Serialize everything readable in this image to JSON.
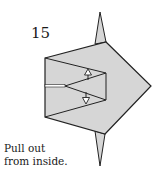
{
  "step": {
    "number": "15"
  },
  "caption": {
    "line1": "Pull out",
    "line2": "from inside."
  },
  "colors": {
    "paper": "#d6d6d6",
    "line": "#222222",
    "background": "#ffffff"
  },
  "arrows": [
    {
      "direction": "up",
      "label": "pull-up-arrow"
    },
    {
      "direction": "down",
      "label": "pull-down-arrow"
    }
  ]
}
